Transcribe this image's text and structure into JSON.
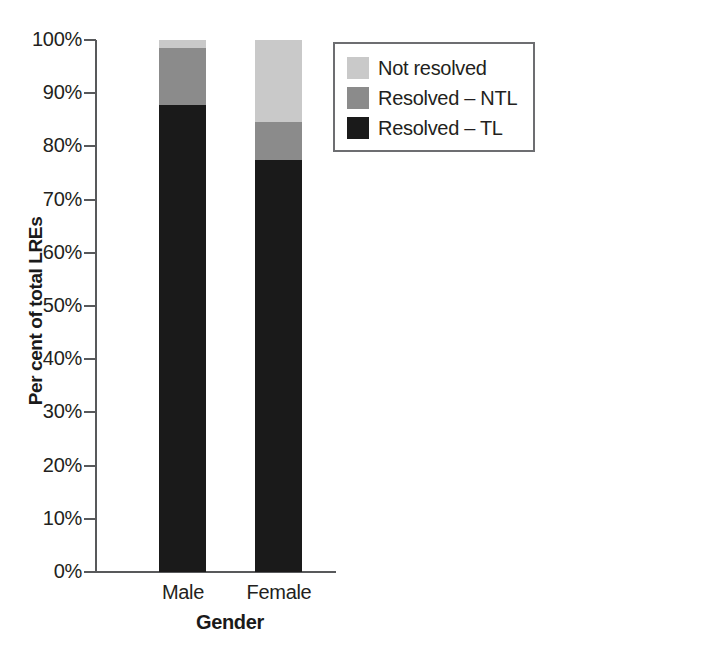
{
  "chart_data": {
    "type": "bar",
    "subtype": "stacked-100-percent",
    "title": "",
    "xlabel": "Gender",
    "ylabel": "Per cent of total LREs",
    "categories": [
      "Male",
      "Female"
    ],
    "ylim": [
      0,
      100
    ],
    "ytick_labels": [
      "100%",
      "90%",
      "80%",
      "70%",
      "60%",
      "50%",
      "40%",
      "30%",
      "20%",
      "10%",
      "0%"
    ],
    "ytick_values": [
      100,
      90,
      80,
      70,
      60,
      50,
      40,
      30,
      20,
      10,
      0
    ],
    "grid": false,
    "legend_position": "top-right-inside",
    "series": [
      {
        "name": "Not resolved",
        "color": "#c9c9c9",
        "values": [
          1.5,
          15.4
        ]
      },
      {
        "name": "Resolved – NTL",
        "color": "#8b8b8b",
        "values": [
          10.7,
          7.1
        ]
      },
      {
        "name": "Resolved – TL",
        "color": "#1a1a1a",
        "values": [
          87.8,
          77.5
        ]
      }
    ]
  },
  "axis": {
    "y_title": "Per cent of total LREs",
    "x_title": "Gender",
    "ticks": [
      {
        "label": "100%",
        "value": 100
      },
      {
        "label": "90%",
        "value": 90
      },
      {
        "label": "80%",
        "value": 80
      },
      {
        "label": "70%",
        "value": 70
      },
      {
        "label": "60%",
        "value": 60
      },
      {
        "label": "50%",
        "value": 50
      },
      {
        "label": "40%",
        "value": 40
      },
      {
        "label": "30%",
        "value": 30
      },
      {
        "label": "20%",
        "value": 20
      },
      {
        "label": "10%",
        "value": 10
      },
      {
        "label": "0%",
        "value": 0
      }
    ],
    "x_categories": [
      {
        "label": "Male"
      },
      {
        "label": "Female"
      }
    ]
  },
  "legend": {
    "items": [
      {
        "label": "Not resolved",
        "color": "#c9c9c9"
      },
      {
        "label": "Resolved – NTL",
        "color": "#8b8b8b"
      },
      {
        "label": "Resolved – TL",
        "color": "#1a1a1a"
      }
    ]
  },
  "colors": {
    "axis": "#58595b",
    "text": "#231f20",
    "legend_border": "#6d6e71",
    "background": "#ffffff"
  }
}
